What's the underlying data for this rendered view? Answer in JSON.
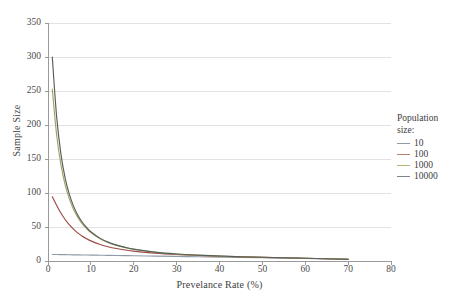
{
  "chart_data": {
    "type": "line",
    "title": "",
    "xlabel": "Prevelance Rate (%)",
    "ylabel": "Sample Size",
    "xlim": [
      0,
      80
    ],
    "ylim": [
      0,
      350
    ],
    "xticks": [
      0,
      10,
      20,
      30,
      40,
      50,
      60,
      70,
      80
    ],
    "yticks": [
      0,
      50,
      100,
      150,
      200,
      250,
      300,
      350
    ],
    "grid": "horizontal",
    "legend_position": "right",
    "legend_title": "Population size:",
    "x": [
      1,
      2,
      3,
      4,
      5,
      6,
      7,
      8,
      9,
      10,
      12,
      14,
      16,
      18,
      20,
      25,
      30,
      35,
      40,
      45,
      50,
      55,
      60,
      65,
      70
    ],
    "series": [
      {
        "name": "10",
        "color": "#8f9aa8",
        "values": [
          9.6,
          9.5,
          9.4,
          9.3,
          9.2,
          9.1,
          9.0,
          8.9,
          8.8,
          8.7,
          8.5,
          8.3,
          8.1,
          7.9,
          7.7,
          7.2,
          6.7,
          6.2,
          5.7,
          5.2,
          4.7,
          4.2,
          3.7,
          3.1,
          2.4
        ]
      },
      {
        "name": "100",
        "color": "#9c4a41",
        "values": [
          94.5,
          82.0,
          70.5,
          61.0,
          53.0,
          46.5,
          41.0,
          36.5,
          32.8,
          29.6,
          24.6,
          21.0,
          18.3,
          16.2,
          14.5,
          11.5,
          9.5,
          8.1,
          7.0,
          6.1,
          5.4,
          4.7,
          4.0,
          3.3,
          2.4
        ]
      },
      {
        "name": "1000",
        "color": "#a8a062",
        "values": [
          253.0,
          186.0,
          142.0,
          112.0,
          91.0,
          75.5,
          63.8,
          54.7,
          47.5,
          41.7,
          33.2,
          27.3,
          23.0,
          19.8,
          17.3,
          12.9,
          10.2,
          8.5,
          7.2,
          6.2,
          5.5,
          4.8,
          4.0,
          3.3,
          2.4
        ]
      },
      {
        "name": "10000",
        "color": "#56605a",
        "values": [
          300.0,
          213.0,
          158.0,
          122.0,
          97.5,
          80.0,
          67.0,
          57.0,
          49.3,
          43.0,
          34.0,
          27.8,
          23.4,
          20.1,
          17.5,
          13.0,
          10.3,
          8.6,
          7.3,
          6.3,
          5.5,
          4.8,
          4.0,
          3.3,
          2.4
        ]
      }
    ]
  },
  "legend": {
    "title_line1": "Population",
    "title_line2": "size:",
    "items": [
      {
        "label": "10",
        "color": "#8f9aa8"
      },
      {
        "label": "100",
        "color": "#b5836c"
      },
      {
        "label": "1000",
        "color": "#b9b07a"
      },
      {
        "label": "10000",
        "color": "#7c858e"
      }
    ]
  },
  "axes": {
    "y_title": "Sample Size",
    "x_title": "Prevelance Rate (%)",
    "y_tick_labels": [
      "0",
      "50",
      "100",
      "150",
      "200",
      "250",
      "300",
      "350"
    ],
    "x_tick_labels": [
      "0",
      "10",
      "20",
      "30",
      "40",
      "50",
      "60",
      "70",
      "80"
    ]
  },
  "style": {
    "grid_color": "#e2e2e2",
    "axis_color": "#9a9a9a",
    "text_color": "#3d3d3d",
    "background": "#ffffff"
  }
}
